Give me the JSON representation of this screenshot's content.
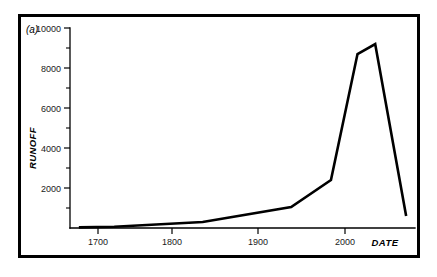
{
  "figure": {
    "panel_label": "(a)",
    "background_color": "#ffffff",
    "frame_color": "#000000",
    "line_color": "#000000"
  },
  "chart_data": {
    "type": "line",
    "title": "",
    "subtitle": "",
    "xlabel": "DATE",
    "ylabel": "RUNOFF",
    "xlim": [
      1650,
      2040
    ],
    "ylim": [
      0,
      10000
    ],
    "grid": false,
    "legend": null,
    "x_ticks": [
      1700,
      1800,
      1900,
      2000
    ],
    "x_tick_labels": [
      "1700",
      "1800",
      "1900",
      "2000"
    ],
    "x_minor_ticks": [
      1750,
      1850,
      1950
    ],
    "y_ticks": [
      0,
      2000,
      4000,
      6000,
      8000,
      10000
    ],
    "y_tick_labels": [
      "",
      "2000",
      "4000",
      "6000",
      "8000",
      "10000"
    ],
    "y_minor_ticks": [
      1000,
      3000,
      5000,
      7000,
      9000
    ],
    "series": [
      {
        "name": "runoff",
        "x": [
          1660,
          1700,
          1800,
          1900,
          1945,
          1975,
          1995,
          2030
        ],
        "values": [
          30,
          60,
          300,
          1050,
          2400,
          8700,
          9200,
          600
        ]
      }
    ],
    "annotations": [
      "(a)"
    ]
  }
}
